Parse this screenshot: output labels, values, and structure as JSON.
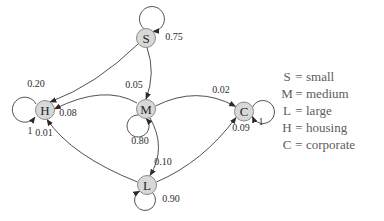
{
  "diagram": {
    "type": "state-transition-diagram",
    "nodes": [
      {
        "id": "S",
        "label": "S"
      },
      {
        "id": "M",
        "label": "M"
      },
      {
        "id": "L",
        "label": "L"
      },
      {
        "id": "H",
        "label": "H"
      },
      {
        "id": "C",
        "label": "C"
      }
    ],
    "transitions": [
      {
        "from": "S",
        "to": "S",
        "probability": "0.75"
      },
      {
        "from": "S",
        "to": "M",
        "probability": "0.05"
      },
      {
        "from": "S",
        "to": "H",
        "probability": "0.20"
      },
      {
        "from": "M",
        "to": "M",
        "probability": "0.80"
      },
      {
        "from": "M",
        "to": "H",
        "probability": "0.08"
      },
      {
        "from": "M",
        "to": "C",
        "probability": "0.02"
      },
      {
        "from": "M",
        "to": "L",
        "probability": "0.10"
      },
      {
        "from": "L",
        "to": "L",
        "probability": "0.90"
      },
      {
        "from": "L",
        "to": "H",
        "probability": "0.01"
      },
      {
        "from": "L",
        "to": "C",
        "probability": "0.09"
      },
      {
        "from": "H",
        "to": "H",
        "probability": "1"
      },
      {
        "from": "C",
        "to": "C",
        "probability": "1"
      }
    ]
  },
  "legend": {
    "separator": "=",
    "items": [
      {
        "key": "S",
        "meaning": "small"
      },
      {
        "key": "M",
        "meaning": "medium"
      },
      {
        "key": "L",
        "meaning": "large"
      },
      {
        "key": "H",
        "meaning": "housing"
      },
      {
        "key": "C",
        "meaning": "corporate"
      }
    ]
  },
  "colors": {
    "background": "#ffffff",
    "node_fill": "#d8d8d8",
    "node_stroke": "#8c8c8c",
    "edge_stroke": "#3d3d3d",
    "arrowhead": "#2a2a2a",
    "probability_text": "#2e2e2e",
    "legend_text": "#5c5c5c"
  }
}
